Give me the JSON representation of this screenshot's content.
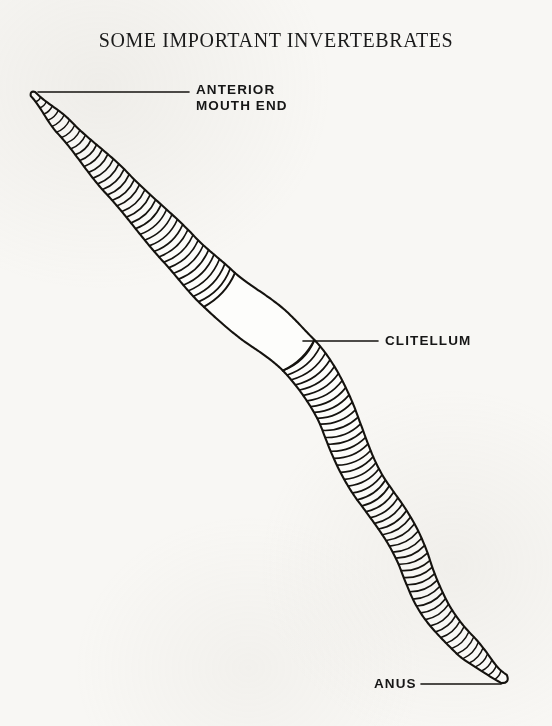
{
  "page": {
    "background_color": "#f8f7f4",
    "ink_color": "#15130f",
    "width": 552,
    "height": 726
  },
  "figure": {
    "title": "SOME IMPORTANT INVERTEBRATES",
    "caption_style": "plate heading"
  },
  "labels": {
    "anterior": "ANTERIOR\nMOUTH END",
    "clitellum": "CLITELLUM",
    "anus": "ANUS"
  },
  "leader_lines": [
    {
      "name": "anterior-leader",
      "x1": 38,
      "y1": 92,
      "x2": 189,
      "y2": 92
    },
    {
      "name": "clitellum-leader",
      "x1": 303,
      "y1": 341,
      "x2": 378,
      "y2": 341
    },
    {
      "name": "anus-leader",
      "x1": 421,
      "y1": 684,
      "x2": 501,
      "y2": 684
    }
  ],
  "worm": {
    "head_tip": [
      31,
      92
    ],
    "tail_tip": [
      506,
      681
    ],
    "segment_count": 104,
    "clitellum_range": [
      0.355,
      0.49
    ],
    "centerline": [
      [
        33,
        94
      ],
      [
        48,
        110
      ],
      [
        64,
        127
      ],
      [
        80,
        144
      ],
      [
        96,
        161
      ],
      [
        112,
        178
      ],
      [
        128,
        195
      ],
      [
        144,
        212
      ],
      [
        160,
        229
      ],
      [
        176,
        246
      ],
      [
        192,
        263
      ],
      [
        208,
        279
      ],
      [
        224,
        294
      ],
      [
        240,
        307
      ],
      [
        256,
        319
      ],
      [
        272,
        331
      ],
      [
        288,
        345
      ],
      [
        303,
        360
      ],
      [
        316,
        377
      ],
      [
        327,
        395
      ],
      [
        336,
        413
      ],
      [
        343,
        431
      ],
      [
        350,
        449
      ],
      [
        358,
        467
      ],
      [
        368,
        485
      ],
      [
        380,
        502
      ],
      [
        392,
        519
      ],
      [
        403,
        537
      ],
      [
        412,
        556
      ],
      [
        419,
        575
      ],
      [
        427,
        594
      ],
      [
        437,
        612
      ],
      [
        450,
        629
      ],
      [
        465,
        645
      ],
      [
        481,
        660
      ],
      [
        494,
        672
      ],
      [
        504,
        679
      ]
    ],
    "width_profile": [
      {
        "t": 0.0,
        "w": 3
      },
      {
        "t": 0.06,
        "w": 9
      },
      {
        "t": 0.16,
        "w": 15
      },
      {
        "t": 0.28,
        "w": 20
      },
      {
        "t": 0.35,
        "w": 23
      },
      {
        "t": 0.42,
        "w": 25
      },
      {
        "t": 0.49,
        "w": 22
      },
      {
        "t": 0.6,
        "w": 19
      },
      {
        "t": 0.72,
        "w": 17
      },
      {
        "t": 0.84,
        "w": 15
      },
      {
        "t": 0.93,
        "w": 12
      },
      {
        "t": 1.0,
        "w": 5
      }
    ]
  }
}
